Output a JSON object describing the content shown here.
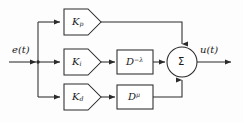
{
  "diagram": {
    "background_color": "#fdfdfd",
    "line_color": "#2b2b2b",
    "text_color": "#1a1a1a",
    "signals": {
      "input_label": "e(t)",
      "output_label": "u(t)"
    },
    "gain_blocks": [
      {
        "id": "kp",
        "label_base": "K",
        "label_sub": "p",
        "branch": "proportional"
      },
      {
        "id": "ki",
        "label_base": "K",
        "label_sub": "i",
        "branch": "integral"
      },
      {
        "id": "kd",
        "label_base": "K",
        "label_sub": "d",
        "branch": "derivative"
      }
    ],
    "operator_blocks": [
      {
        "id": "integrator",
        "label_base": "D",
        "label_sup": "−λ",
        "branch": "integral"
      },
      {
        "id": "differentiator",
        "label_base": "D",
        "label_sup": "μ",
        "branch": "derivative"
      }
    ],
    "summing_junction": {
      "symbol": "Σ",
      "input_count": 3,
      "inputs": [
        "top",
        "left",
        "bottom"
      ]
    }
  }
}
